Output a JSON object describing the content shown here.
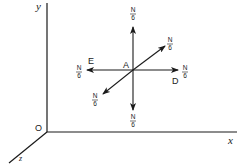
{
  "diagram": {
    "type": "force-vectors-3d-axes",
    "axes": {
      "x_label": "x",
      "y_label": "y",
      "z_label": "z",
      "origin_label": "O"
    },
    "point": {
      "label": "A"
    },
    "vectors": [
      {
        "id": "up",
        "direction": "+y",
        "magnitude_num": "N",
        "magnitude_den": "6"
      },
      {
        "id": "down",
        "direction": "-y",
        "magnitude_num": "N",
        "magnitude_den": "6"
      },
      {
        "id": "right",
        "direction": "+x",
        "magnitude_num": "N",
        "magnitude_den": "6",
        "end_label": "D"
      },
      {
        "id": "left",
        "direction": "-x",
        "magnitude_num": "N",
        "magnitude_den": "6",
        "end_label": "E"
      },
      {
        "id": "back",
        "direction": "-z",
        "magnitude_num": "N",
        "magnitude_den": "6"
      },
      {
        "id": "front",
        "direction": "+z",
        "magnitude_num": "N",
        "magnitude_den": "6"
      }
    ],
    "colors": {
      "stroke": "#1a1a1a",
      "background": "#ffffff"
    }
  }
}
